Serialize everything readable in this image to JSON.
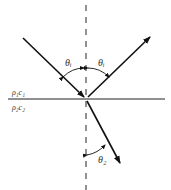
{
  "diagram": {
    "type": "wave-reflection-refraction",
    "labels": {
      "medium1": "ρ₁c₁",
      "medium2": "ρ₂c₂",
      "incident_angle": "θᵢ",
      "reflected_angle": "θᵢ",
      "transmitted_angle": "θ₂"
    },
    "colors": {
      "line": "#111111",
      "text": "#333333",
      "background": "#ffffff"
    }
  }
}
